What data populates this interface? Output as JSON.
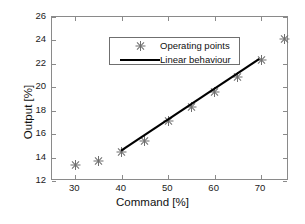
{
  "chart_data": {
    "type": "scatter",
    "title": "",
    "xlabel": "Command [%]",
    "ylabel": "Output [%]",
    "xlim": [
      25,
      76
    ],
    "ylim": [
      12,
      26
    ],
    "xticks": [
      30,
      40,
      50,
      60,
      70
    ],
    "yticks": [
      12,
      14,
      16,
      18,
      20,
      22,
      24,
      26
    ],
    "xtick_labels": [
      "30",
      "40",
      "50",
      "60",
      "70"
    ],
    "ytick_labels": [
      "12",
      "14",
      "16",
      "18",
      "20",
      "22",
      "24",
      "26"
    ],
    "grid": false,
    "legend_position": "upper left",
    "series": [
      {
        "name": "Operating points",
        "marker": "asterisk",
        "color": "#6f6f6f",
        "x": [
          30,
          35,
          40,
          45,
          50,
          55,
          60,
          65,
          70,
          75
        ],
        "y": [
          13.4,
          13.75,
          14.5,
          15.5,
          17.15,
          18.4,
          19.6,
          20.95,
          22.35,
          24.2
        ]
      },
      {
        "name": "Linear behaviour",
        "marker": "line",
        "color": "#000000",
        "x": [
          40,
          70
        ],
        "y": [
          14.5,
          22.4
        ]
      }
    ]
  },
  "legend": {
    "entries": [
      {
        "label": "Operating points",
        "style": "marker"
      },
      {
        "label": "Linear behaviour",
        "style": "line"
      }
    ]
  },
  "colors": {
    "background": "#ffffff",
    "axis": "#8a8a8a",
    "marker": "#6f6f6f",
    "line": "#000000",
    "text": "#111111"
  }
}
